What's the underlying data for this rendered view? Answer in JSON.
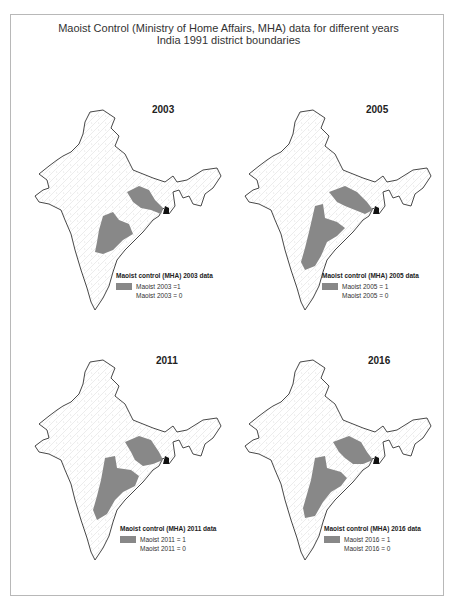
{
  "title": {
    "line1": "Maoist Control (Ministry of Home Affairs, MHA) data for different years",
    "line2": "India 1991 district boundaries"
  },
  "colors": {
    "controlled": "#888888",
    "not_controlled": "#ffffff",
    "boundary": "#333333",
    "districts": "#c8c8c8"
  },
  "panels": [
    {
      "year": "2003",
      "legend_title": "Maoist control (MHA) 2003 data",
      "legend_on": "Maoist 2003 =1",
      "legend_off": "Maoist 2003 = 0"
    },
    {
      "year": "2005",
      "legend_title": "Maoist control (MHA) 2005 data",
      "legend_on": "Maoist 2005 = 1",
      "legend_off": "Maoist 2005 = 0"
    },
    {
      "year": "2011",
      "legend_title": "Maoist control (MHA) 2011 data",
      "legend_on": "Maoist 2011 = 1",
      "legend_off": "Maoist 2011 = 0"
    },
    {
      "year": "2016",
      "legend_title": "Maoist control (MHA) 2016 data",
      "legend_on": "Maoist 2016 = 1",
      "legend_off": "Maoist 2016 = 0"
    }
  ]
}
